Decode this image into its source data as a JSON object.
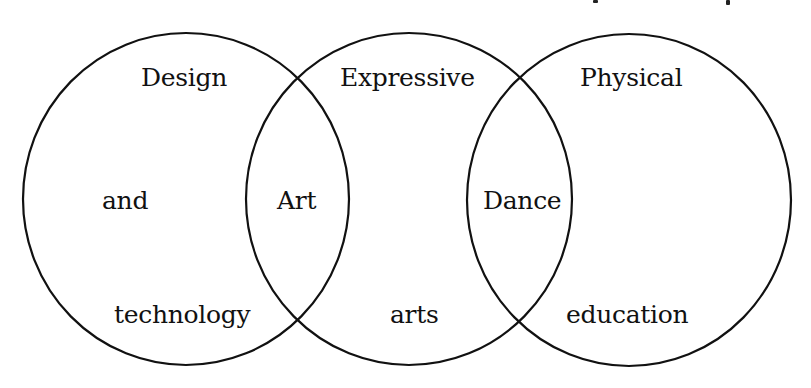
{
  "diagram": {
    "type": "venn",
    "stroke_color": "#111111",
    "background": "#ffffff",
    "sets": [
      {
        "id": "design-technology",
        "label_lines": [
          "Design",
          "and",
          "technology"
        ],
        "cx": 186,
        "cy": 199,
        "rx": 163,
        "ry": 166
      },
      {
        "id": "expressive-arts",
        "label_lines": [
          "Expressive",
          "arts"
        ],
        "cx": 409,
        "cy": 199,
        "rx": 163,
        "ry": 166
      },
      {
        "id": "physical-education",
        "label_lines": [
          "Physical",
          "education"
        ],
        "cx": 629,
        "cy": 200,
        "rx": 162,
        "ry": 166
      }
    ],
    "intersections": [
      {
        "between": [
          "design-technology",
          "expressive-arts"
        ],
        "label": "Art"
      },
      {
        "between": [
          "expressive-arts",
          "physical-education"
        ],
        "label": "Dance"
      }
    ]
  },
  "labels": {
    "design": "Design",
    "and": "and",
    "technology": "technology",
    "expressive": "Expressive",
    "arts": "arts",
    "physical": "Physical",
    "education": "education",
    "art": "Art",
    "dance": "Dance"
  }
}
